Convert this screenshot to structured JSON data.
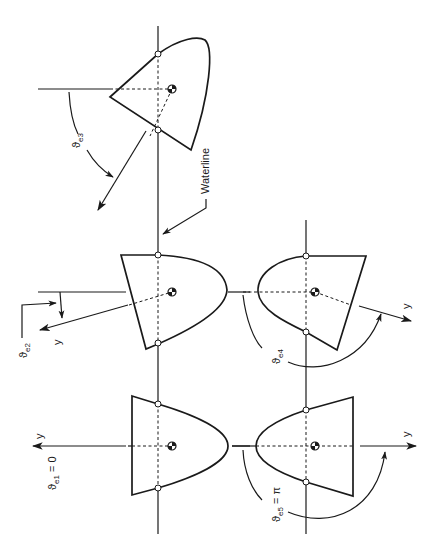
{
  "figure": {
    "labels": {
      "waterline": "Waterline",
      "theta_e1": {
        "symbol": "ϑ",
        "subscript": "e1",
        "suffix": " = 0"
      },
      "theta_e2": {
        "symbol": "ϑ",
        "subscript": "e2",
        "suffix": ""
      },
      "theta_e3": {
        "symbol": "ϑ",
        "subscript": "e3",
        "suffix": ""
      },
      "theta_e4": {
        "symbol": "ϑ",
        "subscript": "e4",
        "suffix": ""
      },
      "theta_e5": {
        "symbol": "ϑ",
        "subscript": "e5",
        "suffix": " = π"
      },
      "y_axis": "y"
    },
    "orientations": [
      {
        "id": "e1",
        "angle": "0",
        "position": "bottom-left"
      },
      {
        "id": "e2",
        "angle": "small roll",
        "position": "middle-left"
      },
      {
        "id": "e3",
        "angle": "large roll",
        "position": "top-left"
      },
      {
        "id": "e4",
        "angle": "near inverted",
        "position": "middle-right"
      },
      {
        "id": "e5",
        "angle": "π",
        "position": "bottom-right"
      }
    ],
    "colors": {
      "ink": "#1a1a1a",
      "background": "#ffffff"
    }
  }
}
